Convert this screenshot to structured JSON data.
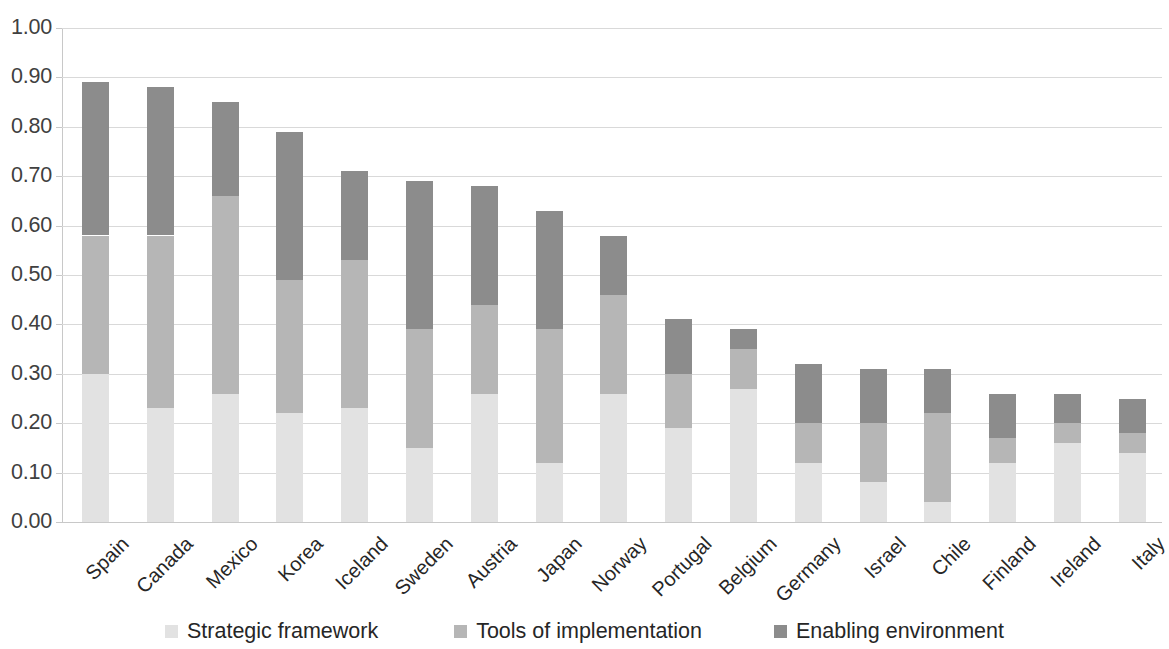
{
  "chart_data": {
    "type": "bar",
    "subtype": "stacked-bar",
    "title": "",
    "xlabel": "",
    "ylabel": "",
    "ylim": [
      0.0,
      1.0
    ],
    "ytick_labels": [
      "1.00",
      "0.90",
      "0.80",
      "0.70",
      "0.60",
      "0.50",
      "0.40",
      "0.30",
      "0.20",
      "0.10",
      "0.00"
    ],
    "ytick_values": [
      1.0,
      0.9,
      0.8,
      0.7,
      0.6,
      0.5,
      0.4,
      0.3,
      0.2,
      0.1,
      0.0
    ],
    "grid": true,
    "legend_position": "bottom",
    "categories": [
      "Spain",
      "Canada",
      "Mexico",
      "Korea",
      "Iceland",
      "Sweden",
      "Austria",
      "Japan",
      "Norway",
      "Portugal",
      "Belgium",
      "Germany",
      "Israel",
      "Chile",
      "Finland",
      "Ireland",
      "Italy"
    ],
    "series": [
      {
        "name": "Strategic framework",
        "color": "#e2e2e2",
        "values": [
          0.3,
          0.23,
          0.26,
          0.22,
          0.23,
          0.15,
          0.26,
          0.12,
          0.26,
          0.19,
          0.27,
          0.12,
          0.08,
          0.04,
          0.12,
          0.16,
          0.14
        ]
      },
      {
        "name": "Tools of implementation",
        "color": "#b6b6b6",
        "values": [
          0.28,
          0.35,
          0.4,
          0.27,
          0.3,
          0.24,
          0.18,
          0.27,
          0.2,
          0.11,
          0.08,
          0.08,
          0.12,
          0.18,
          0.05,
          0.04,
          0.04
        ]
      },
      {
        "name": "Enabling environment",
        "color": "#8c8c8c",
        "values": [
          0.31,
          0.3,
          0.19,
          0.3,
          0.18,
          0.3,
          0.24,
          0.24,
          0.12,
          0.11,
          0.04,
          0.12,
          0.11,
          0.09,
          0.09,
          0.06,
          0.07
        ]
      }
    ],
    "totals": [
      0.885,
      0.88,
      0.848,
      0.785,
      0.707,
      0.685,
      0.682,
      0.628,
      0.58,
      0.41,
      0.385,
      0.318,
      0.305,
      0.305,
      0.26,
      0.257,
      0.247
    ]
  },
  "legend": {
    "items": [
      {
        "label": "Strategic framework",
        "color": "#e2e2e2"
      },
      {
        "label": "Tools of implementation",
        "color": "#b6b6b6"
      },
      {
        "label": "Enabling environment",
        "color": "#8c8c8c"
      }
    ]
  }
}
